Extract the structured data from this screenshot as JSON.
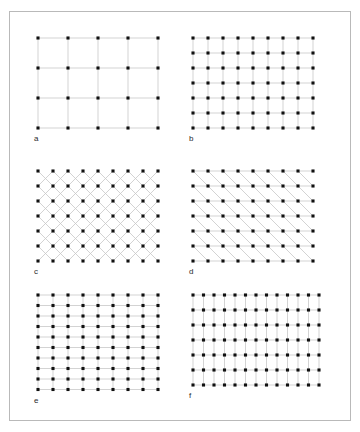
{
  "figure": {
    "background_color": "#ffffff",
    "frame_color": "#b9b9b9",
    "dot_color": "#111111",
    "line_color": "#c8c8c8",
    "label_color": "#2b2b2b",
    "panels": [
      {
        "id": "a",
        "label": "a",
        "lattice_name": "square-coarse",
        "cols": 5,
        "rows": 4,
        "spacing_x": 30,
        "spacing_y": 30,
        "lines": [
          "horizontal",
          "vertical"
        ]
      },
      {
        "id": "b",
        "label": "b",
        "lattice_name": "square-fine",
        "cols": 9,
        "rows": 7,
        "spacing_x": 15,
        "spacing_y": 15,
        "lines": [
          "horizontal",
          "vertical"
        ]
      },
      {
        "id": "c",
        "label": "c",
        "lattice_name": "square-diagonal-cross",
        "cols": 9,
        "rows": 7,
        "spacing_x": 15,
        "spacing_y": 15,
        "lines": [
          "diagonal-up",
          "diagonal-down"
        ]
      },
      {
        "id": "d",
        "label": "d",
        "lattice_name": "oblique-horizontal-diagonal",
        "cols": 9,
        "rows": 7,
        "spacing_x": 15,
        "spacing_y": 15,
        "lines": [
          "horizontal",
          "diagonal-up"
        ]
      },
      {
        "id": "e",
        "label": "e",
        "lattice_name": "rectangular-tall",
        "cols": 9,
        "rows": 10,
        "spacing_x": 15,
        "spacing_y": 10.5,
        "lines": [
          "horizontal",
          "vertical"
        ]
      },
      {
        "id": "f",
        "label": "f",
        "lattice_name": "rectangular-wide",
        "cols": 13,
        "rows": 7,
        "spacing_x": 10.5,
        "spacing_y": 15,
        "lines": [
          "horizontal",
          "vertical"
        ]
      }
    ],
    "layout": {
      "panel_origins": [
        {
          "id": "a",
          "x": 38,
          "y": 38
        },
        {
          "id": "b",
          "x": 193,
          "y": 38
        },
        {
          "id": "c",
          "x": 38,
          "y": 171
        },
        {
          "id": "d",
          "x": 193,
          "y": 171
        },
        {
          "id": "e",
          "x": 38,
          "y": 295
        },
        {
          "id": "f",
          "x": 193,
          "y": 295
        }
      ]
    }
  },
  "chart_data": {
    "type": "scatter",
    "title": "",
    "xlabel": "",
    "ylabel": "",
    "panels": [
      {
        "label": "a",
        "type": "square lattice (coarse)",
        "grid": "5 x 4",
        "point_count": 20,
        "connector_lines": "horizontal and vertical"
      },
      {
        "label": "b",
        "type": "square lattice (fine)",
        "grid": "9 x 7",
        "point_count": 63,
        "connector_lines": "horizontal and vertical"
      },
      {
        "label": "c",
        "type": "square lattice with diagonals",
        "grid": "9 x 7",
        "point_count": 63,
        "connector_lines": "both diagonals (X net)"
      },
      {
        "label": "d",
        "type": "oblique / centred lattice",
        "grid": "9 x 7",
        "point_count": 63,
        "connector_lines": "horizontal and one diagonal"
      },
      {
        "label": "e",
        "type": "rectangular lattice (tall cells)",
        "grid": "9 x 10",
        "point_count": 90,
        "connector_lines": "horizontal and vertical"
      },
      {
        "label": "f",
        "type": "rectangular lattice (wide cells)",
        "grid": "13 x 7",
        "point_count": 91,
        "connector_lines": "horizontal and vertical"
      }
    ]
  }
}
